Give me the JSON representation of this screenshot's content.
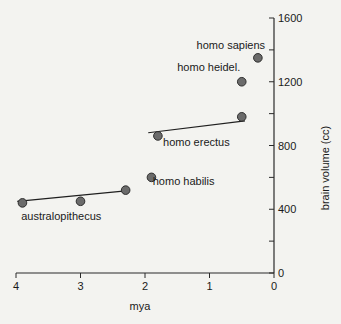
{
  "chart_data": {
    "type": "scatter",
    "title": "",
    "xlabel": "mya",
    "ylabel": "brain volume (cc)",
    "xlim": [
      4,
      0
    ],
    "ylim": [
      0,
      1600
    ],
    "x_ticks": [
      4,
      3,
      2,
      1,
      0
    ],
    "x_tick_labels": [
      "4",
      "3",
      "2",
      "1",
      "0"
    ],
    "y_ticks": [
      0,
      200,
      400,
      600,
      800,
      1000,
      1200,
      1400,
      1600
    ],
    "y_tick_labels": [
      "0",
      "",
      "400",
      "",
      "800",
      "",
      "1200",
      "",
      "1600"
    ],
    "y_axis_position": "right",
    "grid": false,
    "legend": null,
    "points": [
      {
        "x": 3.9,
        "y": 440
      },
      {
        "x": 3.0,
        "y": 450
      },
      {
        "x": 2.3,
        "y": 520
      },
      {
        "x": 1.9,
        "y": 600
      },
      {
        "x": 1.8,
        "y": 860
      },
      {
        "x": 0.5,
        "y": 980
      },
      {
        "x": 0.5,
        "y": 1200
      },
      {
        "x": 0.25,
        "y": 1350
      }
    ],
    "trend_lines": [
      {
        "group": "australopithecus",
        "from": {
          "x": 3.98,
          "y": 450
        },
        "to": {
          "x": 2.3,
          "y": 515
        }
      },
      {
        "group": "homo erectus",
        "from": {
          "x": 1.95,
          "y": 880
        },
        "to": {
          "x": 0.45,
          "y": 955
        }
      }
    ],
    "annotations": [
      {
        "text": "australopithecus",
        "x": 3.92,
        "y": 330
      },
      {
        "text": "homo habilis",
        "x": 1.88,
        "y": 550
      },
      {
        "text": "homo erectus",
        "x": 1.72,
        "y": 800
      },
      {
        "text": "homo heidel.",
        "x": 1.5,
        "y": 1270
      },
      {
        "text": "homo sapiens",
        "x": 1.2,
        "y": 1405
      }
    ],
    "colors": {
      "background": "#f3f3f0",
      "axis": "#2a2a2a",
      "point_fill": "#6b6b6b",
      "point_stroke": "#2e2e2e",
      "line": "#1f1f1f",
      "text": "#1a1a1a"
    }
  }
}
